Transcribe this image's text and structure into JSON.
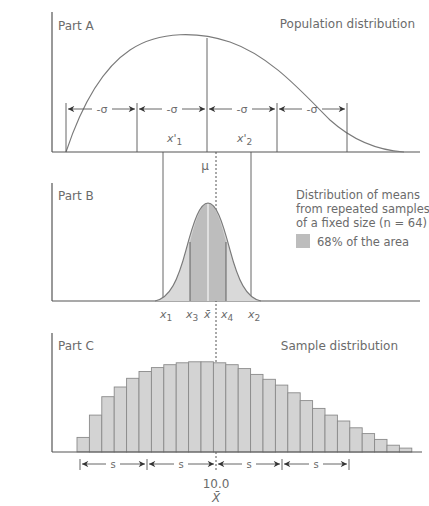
{
  "parts": {
    "a": {
      "label": "Part A",
      "title": "Population distribution",
      "sigma_label": "-σ",
      "x1_label": "x'",
      "x1_sub": "1",
      "x2_label": "x'",
      "x2_sub": "2"
    },
    "b": {
      "label": "Part B",
      "mu_label": "μ",
      "legend_line1": "Distribution of means",
      "legend_line2": "from repeated samples",
      "legend_line3": "of a fixed size (n = 64)",
      "legend_swatch_label": "68% of the area",
      "ticks": {
        "x1": "x",
        "x1_sub": "1",
        "x3": "x",
        "x3_sub": "3",
        "xbar": "x̄",
        "x4": "x",
        "x4_sub": "4",
        "x2": "x",
        "x2_sub": "2"
      }
    },
    "c": {
      "label": "Part C",
      "title": "Sample distribution",
      "s_label": "s",
      "center_value": "10.0",
      "center_symbol": "X̄"
    }
  },
  "colors": {
    "axis": "#555555",
    "curve": "#7a7a7a",
    "fill_light": "#d6d6d6",
    "fill_dark": "#bdbdbd",
    "bar_fill": "#d3d3d3",
    "bar_stroke": "#8a8a8a",
    "text": "#6b6b6b"
  },
  "chart_data": [
    {
      "type": "line",
      "title": "Population distribution",
      "panel": "Part A",
      "description": "Right-skewed population curve with ±σ intervals marked around μ",
      "intervals": [
        "-σ",
        "-σ",
        "-σ",
        "-σ"
      ],
      "markers": [
        "x'1",
        "μ",
        "x'2"
      ]
    },
    {
      "type": "area",
      "title": "Distribution of means from repeated samples of a fixed size (n = 64)",
      "panel": "Part B",
      "legend": [
        "68% of the area"
      ],
      "markers": [
        "x1",
        "x3",
        "x̄",
        "μ",
        "x4",
        "x2"
      ]
    },
    {
      "type": "bar",
      "title": "Sample distribution",
      "panel": "Part C",
      "center_label": "10.0 (X̄)",
      "interval_labels": [
        "s",
        "s",
        "s",
        "s"
      ],
      "relative_heights": [
        0.15,
        0.38,
        0.57,
        0.67,
        0.76,
        0.83,
        0.87,
        0.9,
        0.92,
        0.93,
        0.93,
        0.92,
        0.9,
        0.86,
        0.8,
        0.75,
        0.69,
        0.61,
        0.53,
        0.45,
        0.38,
        0.32,
        0.25,
        0.19,
        0.13,
        0.07,
        0.04
      ]
    }
  ]
}
